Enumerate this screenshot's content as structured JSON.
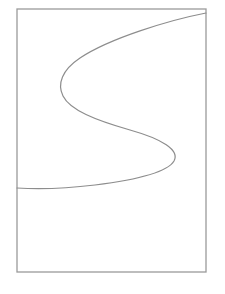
{
  "figure": {
    "title": "",
    "background_color": "#ffffff",
    "canvas": {
      "width": 225,
      "height": 294
    },
    "frame": {
      "name": "rectangle-border",
      "x": 17,
      "y": 9,
      "width": 189,
      "height": 263,
      "stroke_color": "#9a9a9a",
      "stroke_width": 1.3,
      "fill": "none"
    },
    "curve": {
      "name": "s-curve",
      "stroke_color": "#8d8d8d",
      "stroke_width": 1.2,
      "fill": "none",
      "description": "sigmoid s-shaped curve",
      "start_point": {
        "x": 206,
        "y": 13
      },
      "end_point": {
        "x": 17,
        "y": 188
      },
      "left_apex": {
        "x": 60,
        "y": 84
      },
      "right_apex": {
        "x": 178,
        "y": 143
      },
      "path": "M 206 13 C 170 20, 110 38, 80 58 C 62 70, 57 84, 63 96 C 70 110, 95 120, 130 130 C 162 139, 180 150, 174 161 C 167 173, 135 180, 95 185 C 62 189, 33 189, 17 188"
    }
  }
}
